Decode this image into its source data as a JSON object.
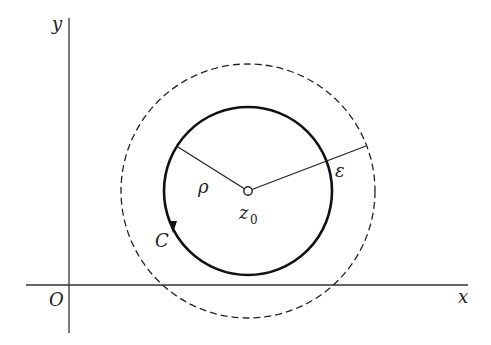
{
  "diagram": {
    "title": "",
    "axes": {
      "x_label": "x",
      "y_label": "y",
      "origin_label": "O"
    },
    "center": {
      "label": "z",
      "subscript": "0"
    },
    "contour": {
      "label": "C",
      "radius_label": "ρ",
      "orientation": "counterclockwise"
    },
    "neighborhood": {
      "radius_label": "ε",
      "style": "dashed"
    },
    "colors": {
      "stroke": "#1a1a1a",
      "background": "#ffffff"
    }
  }
}
